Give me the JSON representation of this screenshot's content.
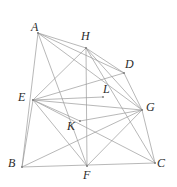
{
  "figure": {
    "width": 177,
    "height": 187,
    "background_color": "#ffffff",
    "stroke_color": "#9a9a9a",
    "label_color": "#2b2b2b",
    "points": [
      {
        "id": "A",
        "label": "A",
        "x": 38,
        "y": 33,
        "label_x": 31,
        "label_y": 21,
        "kind": "vertex"
      },
      {
        "id": "H",
        "label": "H",
        "x": 86,
        "y": 48,
        "label_x": 81,
        "label_y": 30,
        "kind": "vertex"
      },
      {
        "id": "D",
        "label": "D",
        "x": 124,
        "y": 73,
        "label_x": 125,
        "label_y": 58,
        "kind": "vertex"
      },
      {
        "id": "E",
        "label": "E",
        "x": 33,
        "y": 100,
        "label_x": 18,
        "label_y": 91,
        "kind": "vertex"
      },
      {
        "id": "L",
        "label": "L",
        "x": 103,
        "y": 97,
        "label_x": 103,
        "label_y": 83,
        "kind": "vertex"
      },
      {
        "id": "G",
        "label": "G",
        "x": 142,
        "y": 110,
        "label_x": 146,
        "label_y": 101,
        "kind": "vertex"
      },
      {
        "id": "K",
        "label": "K",
        "x": 80,
        "y": 121,
        "label_x": 67,
        "label_y": 120,
        "kind": "vertex"
      },
      {
        "id": "B",
        "label": "B",
        "x": 22,
        "y": 167,
        "label_x": 8,
        "label_y": 157,
        "kind": "vertex"
      },
      {
        "id": "F",
        "label": "F",
        "x": 87,
        "y": 166,
        "label_x": 83,
        "label_y": 169,
        "kind": "vertex"
      },
      {
        "id": "C",
        "label": "C",
        "x": 155,
        "y": 163,
        "label_x": 157,
        "label_y": 157,
        "kind": "vertex"
      }
    ],
    "segments": [
      {
        "name": "A-B",
        "from": "A",
        "to": "B"
      },
      {
        "name": "A-H",
        "from": "A",
        "to": "H"
      },
      {
        "name": "A-D",
        "from": "A",
        "to": "D"
      },
      {
        "name": "A-G",
        "from": "A",
        "to": "G"
      },
      {
        "name": "A-F",
        "from": "A",
        "to": "F"
      },
      {
        "name": "H-D",
        "from": "H",
        "to": "D"
      },
      {
        "name": "H-E",
        "from": "H",
        "to": "E"
      },
      {
        "name": "H-F",
        "from": "H",
        "to": "F"
      },
      {
        "name": "H-G",
        "from": "H",
        "to": "G"
      },
      {
        "name": "H-C",
        "from": "H",
        "to": "C"
      },
      {
        "name": "D-G",
        "from": "D",
        "to": "G"
      },
      {
        "name": "D-E",
        "from": "D",
        "to": "E"
      },
      {
        "name": "E-G",
        "from": "E",
        "to": "G"
      },
      {
        "name": "E-L",
        "from": "E",
        "to": "L"
      },
      {
        "name": "E-B",
        "from": "E",
        "to": "B"
      },
      {
        "name": "E-F",
        "from": "E",
        "to": "F"
      },
      {
        "name": "E-C",
        "from": "E",
        "to": "C"
      },
      {
        "name": "K-G",
        "from": "K",
        "to": "G"
      },
      {
        "name": "E-K",
        "from": "E",
        "to": "K"
      },
      {
        "name": "G-C",
        "from": "G",
        "to": "C"
      },
      {
        "name": "G-F",
        "from": "G",
        "to": "F"
      },
      {
        "name": "G-B",
        "from": "G",
        "to": "B"
      },
      {
        "name": "B-C",
        "from": "B",
        "to": "C"
      }
    ]
  }
}
